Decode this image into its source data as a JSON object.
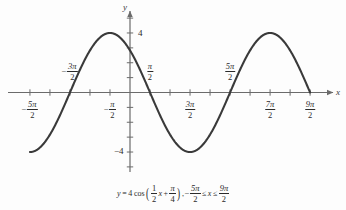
{
  "figure": {
    "background_color": "#fdfdfd",
    "curve_color": "#3a3a3a",
    "axis_color": "#6b6b6b",
    "text_color": "#2b2b2b"
  },
  "axes": {
    "x_axis_label": "x",
    "y_axis_label": "y",
    "x_ticks": [
      {
        "value": -7.853981634,
        "label_num": "5π",
        "label_den": "2",
        "sign": "−",
        "position": "below"
      },
      {
        "value": -6.283185307,
        "label_num": "",
        "label_den": "",
        "sign": "",
        "position": "none"
      },
      {
        "value": -4.71238898,
        "label_num": "3π",
        "label_den": "2",
        "sign": "−",
        "position": "above"
      },
      {
        "value": -3.141592654,
        "label_num": "",
        "label_den": "",
        "sign": "",
        "position": "none"
      },
      {
        "value": -1.570796327,
        "label_num": "π",
        "label_den": "2",
        "sign": "−",
        "position": "below"
      },
      {
        "value": 1.570796327,
        "label_num": "π",
        "label_den": "2",
        "sign": "",
        "position": "above"
      },
      {
        "value": 3.141592654,
        "label_num": "",
        "label_den": "",
        "sign": "",
        "position": "none"
      },
      {
        "value": 4.71238898,
        "label_num": "3π",
        "label_den": "2",
        "sign": "",
        "position": "below"
      },
      {
        "value": 6.283185307,
        "label_num": "",
        "label_den": "",
        "sign": "",
        "position": "none"
      },
      {
        "value": 7.853981634,
        "label_num": "5π",
        "label_den": "2",
        "sign": "",
        "position": "above"
      },
      {
        "value": 9.424777961,
        "label_num": "",
        "label_den": "",
        "sign": "",
        "position": "none"
      },
      {
        "value": 10.99557429,
        "label_num": "7π",
        "label_den": "2",
        "sign": "",
        "position": "below"
      },
      {
        "value": 12.56637061,
        "label_num": "",
        "label_den": "",
        "sign": "",
        "position": "none"
      },
      {
        "value": 14.13716694,
        "label_num": "9π",
        "label_den": "2",
        "sign": "",
        "position": "below"
      }
    ],
    "y_ticks": [
      {
        "value": -5,
        "label": ""
      },
      {
        "value": -4,
        "label": "−4"
      },
      {
        "value": -3,
        "label": ""
      },
      {
        "value": -2,
        "label": ""
      },
      {
        "value": -1,
        "label": ""
      },
      {
        "value": 1,
        "label": ""
      },
      {
        "value": 2,
        "label": ""
      },
      {
        "value": 3,
        "label": ""
      },
      {
        "value": 4,
        "label": "4"
      },
      {
        "value": 5,
        "label": ""
      }
    ]
  },
  "caption": {
    "lhs": "y",
    "equals": "=",
    "amplitude": "4",
    "function_name": "cos",
    "inner_coefficient_num": "1",
    "inner_coefficient_den": "2",
    "inner_variable": "x",
    "plus": "+",
    "phase_num": "π",
    "phase_den": "4",
    "comma": ",",
    "domain_lower_sign": "−",
    "domain_lower_num": "5π",
    "domain_lower_den": "2",
    "le_left": "≤",
    "domain_variable": "x",
    "le_right": "≤",
    "domain_upper_num": "9π",
    "domain_upper_den": "2"
  },
  "chart_data": {
    "type": "line",
    "title": "",
    "subtitle": "",
    "xlabel": "x",
    "ylabel": "y",
    "equation": "y = 4 cos( (1/2) x + π/4 ), −5π/2 ≤ x ≤ 9π/2",
    "amplitude": 4,
    "period": 12.566370614,
    "frequency": 0.5,
    "phase_shift": -1.570796327,
    "vertical_shift": 0,
    "grid": false,
    "legend": false,
    "xlim": [
      -8.639379797,
      15.70796327
    ],
    "ylim": [
      -5.2,
      5.2
    ],
    "domain": [
      -7.853981634,
      14.13716694
    ],
    "xtick_labels": [
      "-5π/2",
      "-3π/2",
      "-π/2",
      "π/2",
      "3π/2",
      "5π/2",
      "7π/2",
      "9π/2"
    ],
    "xtick_values": [
      -7.853981634,
      -4.71238898,
      -1.570796327,
      1.570796327,
      4.71238898,
      7.853981634,
      10.99557429,
      14.13716694
    ],
    "ytick_labels": [
      "4",
      "-4"
    ],
    "ytick_values": [
      4,
      -4
    ],
    "key_points": [
      {
        "x": -7.853981634,
        "y": -4,
        "note": "left endpoint, minimum"
      },
      {
        "x": -4.71238898,
        "y": 0,
        "note": "zero, rising"
      },
      {
        "x": -1.570796327,
        "y": 4,
        "note": "maximum"
      },
      {
        "x": 1.570796327,
        "y": 0,
        "note": "zero, falling"
      },
      {
        "x": 4.71238898,
        "y": -4,
        "note": "minimum"
      },
      {
        "x": 7.853981634,
        "y": 0,
        "note": "zero, rising"
      },
      {
        "x": 10.99557429,
        "y": 4,
        "note": "maximum"
      },
      {
        "x": 14.13716694,
        "y": 0,
        "note": "right endpoint, zero falling"
      }
    ],
    "series": [
      {
        "name": "y = 4 cos(x/2 + π/4)",
        "x": [
          -7.853981634,
          -7.330382858,
          -6.806784083,
          -6.283185307,
          -5.759586532,
          -5.235987756,
          -4.71238898,
          -4.188790205,
          -3.665191429,
          -3.141592654,
          -2.617993878,
          -2.094395102,
          -1.570796327,
          -1.047197551,
          -0.523598776,
          0,
          0.523598776,
          1.047197551,
          1.570796327,
          2.094395102,
          2.617993878,
          3.141592654,
          3.665191429,
          4.188790205,
          4.71238898,
          5.235987756,
          5.759586532,
          6.283185307,
          6.806784083,
          7.330382858,
          7.853981634,
          8.377580409,
          8.901179185,
          9.424777961,
          9.948376736,
          10.47197551,
          10.99557429,
          11.51917306,
          12.04277184,
          12.56637061,
          13.08996939,
          13.61356817,
          14.13716694
        ],
        "y": [
          -4,
          -3.863703305,
          -3.464101615,
          -2.828427125,
          -2,
          -1.035276181,
          0,
          1.035276181,
          2,
          2.828427125,
          3.464101615,
          3.863703305,
          4,
          3.863703305,
          3.464101615,
          2.828427125,
          2,
          1.035276181,
          0,
          -1.035276181,
          -2,
          -2.828427125,
          -3.464101615,
          -3.863703305,
          -4,
          -3.863703305,
          -3.464101615,
          -2.828427125,
          -2,
          -1.035276181,
          0,
          1.035276181,
          2,
          2.828427125,
          3.464101615,
          3.863703305,
          4,
          3.863703305,
          3.464101615,
          2.828427125,
          2,
          1.035276181,
          0
        ]
      }
    ]
  }
}
